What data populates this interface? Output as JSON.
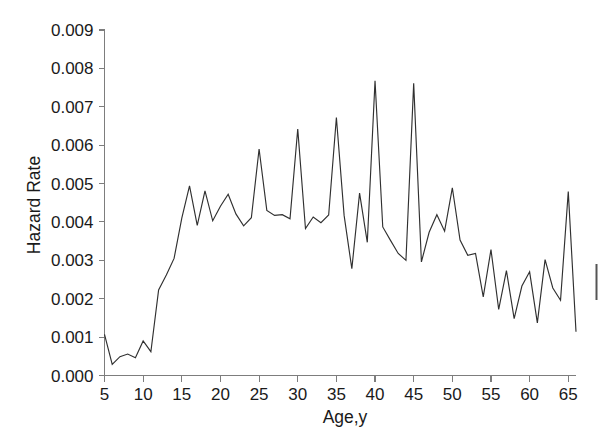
{
  "chart_data": {
    "type": "line",
    "title": "",
    "subtitle": "",
    "xlabel": "Age,y",
    "ylabel": "Hazard Rate",
    "xlim": [
      5,
      66
    ],
    "ylim": [
      0.0,
      0.009
    ],
    "grid": false,
    "legend": null,
    "xticks": [
      5,
      10,
      15,
      20,
      25,
      30,
      35,
      40,
      45,
      50,
      55,
      60,
      65
    ],
    "xticklabels": [
      "5",
      "10",
      "15",
      "20",
      "25",
      "30",
      "35",
      "40",
      "45",
      "50",
      "55",
      "60",
      "65"
    ],
    "yticks": [
      0.0,
      0.001,
      0.002,
      0.003,
      0.004,
      0.005,
      0.006,
      0.007,
      0.008,
      0.009
    ],
    "yticklabels": [
      "0.000",
      "0.001",
      "0.002",
      "0.003",
      "0.004",
      "0.005",
      "0.006",
      "0.007",
      "0.008",
      "0.009"
    ],
    "line_color": "#303030",
    "axis_color": "#7d7d7d",
    "series": [
      {
        "name": "Hazard Rate",
        "x": [
          5,
          6,
          7,
          8,
          9,
          10,
          11,
          12,
          13,
          14,
          15,
          16,
          17,
          18,
          19,
          20,
          21,
          22,
          23,
          24,
          25,
          26,
          27,
          28,
          29,
          30,
          31,
          32,
          33,
          34,
          35,
          36,
          37,
          38,
          39,
          40,
          41,
          42,
          43,
          44,
          45,
          46,
          47,
          48,
          49,
          50,
          51,
          52,
          53,
          54,
          55,
          56,
          57,
          58,
          59,
          60,
          61,
          62,
          63,
          64,
          65,
          66
        ],
        "values": [
          0.00107,
          0.00029,
          0.00049,
          0.00056,
          0.00046,
          0.0009,
          0.00062,
          0.00223,
          0.00262,
          0.00305,
          0.0041,
          0.00494,
          0.00391,
          0.00481,
          0.00403,
          0.00441,
          0.00472,
          0.00421,
          0.0039,
          0.00411,
          0.0059,
          0.0043,
          0.00417,
          0.00419,
          0.00408,
          0.00642,
          0.00383,
          0.00413,
          0.00398,
          0.00418,
          0.00672,
          0.00417,
          0.00278,
          0.00475,
          0.00347,
          0.00768,
          0.00387,
          0.00352,
          0.00318,
          0.003,
          0.00761,
          0.00296,
          0.00373,
          0.00419,
          0.00376,
          0.00489,
          0.00353,
          0.00313,
          0.00318,
          0.00205,
          0.00328,
          0.00172,
          0.00273,
          0.00148,
          0.00233,
          0.0027,
          0.00137,
          0.00302,
          0.00228,
          0.00196,
          0.00479,
          0.00114
        ]
      }
    ]
  },
  "axis": {
    "y_title": "Hazard Rate",
    "x_title": "Age,y"
  }
}
